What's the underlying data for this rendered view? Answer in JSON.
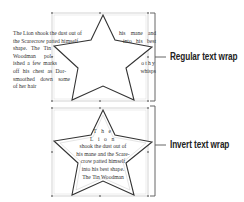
{
  "figure": {
    "examples": [
      {
        "id": "regular",
        "label": "Regular text wrap",
        "left_text_lines": [
          "The Lion shook the dust out of",
          "the Scarecrow patted himself",
          "shape. The Tin",
          "Woodman pol-",
          "ished a few marks",
          "off his chest as Dor-",
          "smoothed down some",
          "of her hair"
        ],
        "right_text_lines": [
          "his mane and",
          "into his best",
          "othy",
          "whisps"
        ]
      },
      {
        "id": "invert",
        "label": "Invert text wrap",
        "inner_text_lines": [
          "T h e",
          "L i o n",
          "shook the dust out of",
          "his mane and the Scare-",
          "crow patted himself",
          "into his best shape.",
          "The Tin Woodman"
        ]
      }
    ],
    "colors": {
      "star_stroke": "#333333",
      "frame_stroke": "#9a9a9a",
      "bracket_stroke": "#555555",
      "text": "#333333"
    }
  }
}
